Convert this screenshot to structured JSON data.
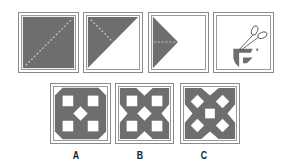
{
  "figure": {
    "colors": {
      "fill": "#6e6e6e",
      "border": "#8a8a8a",
      "fold_line": "#c8c8c8",
      "background": "#ffffff"
    },
    "steps": [
      {
        "id": "step-1",
        "description": "full square paper with diagonal fold line"
      },
      {
        "id": "step-2",
        "description": "folded into triangle along diagonal"
      },
      {
        "id": "step-3",
        "description": "folded again into smaller triangle"
      },
      {
        "id": "step-4",
        "description": "scissors cutting pieces from folded paper"
      }
    ],
    "options": [
      {
        "label": "A"
      },
      {
        "label": "B"
      },
      {
        "label": "C"
      }
    ]
  }
}
